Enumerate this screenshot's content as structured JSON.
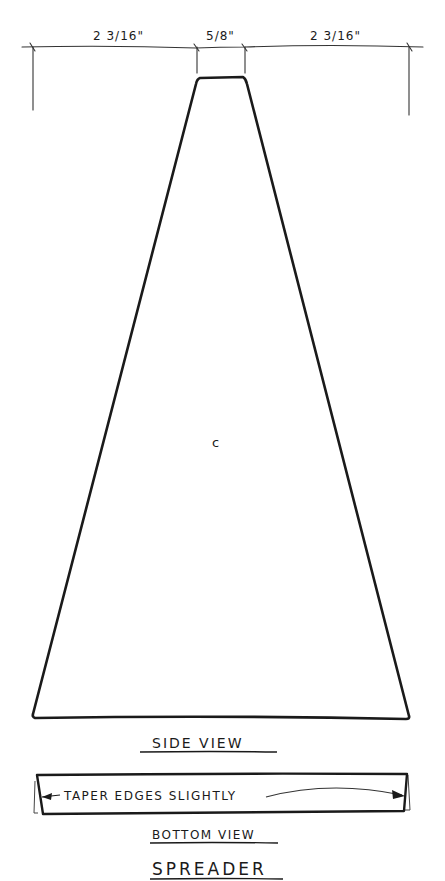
{
  "drawing": {
    "title": "SPREADER",
    "colors": {
      "ink": "#1a1a1a",
      "thin_ink": "#333333",
      "paper": "#ffffff"
    },
    "dimensions": {
      "left": "2 3/16\"",
      "center": "5/8\"",
      "right": "2 3/16\""
    },
    "side_view": {
      "part_label": "C",
      "caption": "SIDE VIEW"
    },
    "bottom_view": {
      "note": "TAPER EDGES SLIGHTLY",
      "caption": "BOTTOM VIEW"
    }
  }
}
